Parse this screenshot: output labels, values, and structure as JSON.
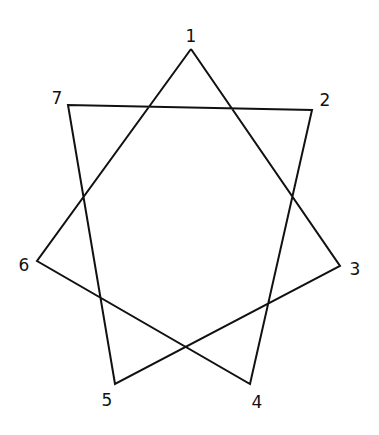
{
  "diagram": {
    "type": "heptagram",
    "stroke_color": "#111111",
    "background": "#ffffff",
    "vertices": [
      {
        "id": "1",
        "label": "1",
        "x": 191,
        "y": 49,
        "lx": 191,
        "ly": 42
      },
      {
        "id": "2",
        "label": "2",
        "x": 312,
        "y": 110,
        "lx": 325,
        "ly": 106
      },
      {
        "id": "3",
        "label": "3",
        "x": 340,
        "y": 266,
        "lx": 355,
        "ly": 275
      },
      {
        "id": "4",
        "label": "4",
        "x": 250,
        "y": 384,
        "lx": 257,
        "ly": 408
      },
      {
        "id": "5",
        "label": "5",
        "x": 115,
        "y": 384,
        "lx": 107,
        "ly": 406
      },
      {
        "id": "6",
        "label": "6",
        "x": 37,
        "y": 261,
        "lx": 24,
        "ly": 271
      },
      {
        "id": "7",
        "label": "7",
        "x": 68,
        "y": 105,
        "lx": 57,
        "ly": 104
      }
    ],
    "path_order": [
      "1",
      "3",
      "5",
      "7",
      "2",
      "4",
      "6",
      "1"
    ]
  }
}
